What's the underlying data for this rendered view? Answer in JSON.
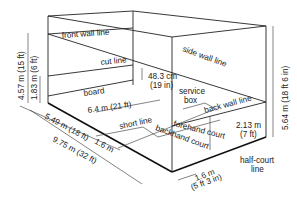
{
  "diagram": {
    "labels": {
      "front_wall_line": "front wall line",
      "side_wall_line": "side wall line",
      "cut_line": "cut line",
      "board": "board",
      "service_box": "service",
      "service_box_2": "box",
      "back_wall_line": "back wall line",
      "short_line": "short line",
      "forehand_court": "forehand court",
      "backhand_court": "backhand court",
      "half_court_line": "half-court",
      "half_court_line_2": "line"
    },
    "dimensions": {
      "front_wall_height": "4.57 m (15 ft)",
      "cut_line_height": "1.83 m (6 ft)",
      "board_height": "48.3 cm",
      "board_height_imperial": "(19 in)",
      "court_width": "6.4 m (21 ft)",
      "front_to_short_line": "5.49 m (18 ft)",
      "service_box_depth": "1.6 m",
      "court_length": "9.75 m (32 ft)",
      "back_wall_height": "2.13 m",
      "back_wall_height_imperial": "(7 ft)",
      "side_wall_height": "5.64 m (18 ft 6 in)",
      "service_box_width": "1.6 m",
      "service_box_width_imperial": "(5 ft 3 in)"
    }
  }
}
